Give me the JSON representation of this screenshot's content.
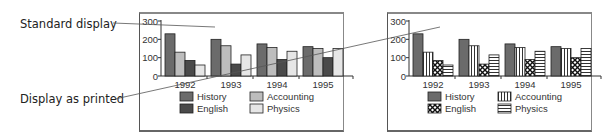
{
  "callouts": {
    "standard": "Standard display",
    "printed": "Display as printed"
  },
  "colors": {
    "history": "#6b6b6b",
    "accounting": "#bdbdbd",
    "english": "#4a4a4a",
    "physics": "#e6e6e6",
    "frame": "#555555"
  },
  "legend": {
    "history": "History",
    "accounting": "Accounting",
    "english": "English",
    "physics": "Physics"
  },
  "axis": {
    "y_ticks": [
      "0",
      "100",
      "200",
      "300"
    ],
    "x_ticks": [
      "1992",
      "1993",
      "1994",
      "1995"
    ]
  },
  "chart_data": [
    {
      "type": "bar",
      "title": "Standard display",
      "categories": [
        "1992",
        "1993",
        "1994",
        "1995"
      ],
      "series": [
        {
          "name": "History",
          "values": [
            230,
            200,
            175,
            160
          ],
          "fill": "solid dark gray"
        },
        {
          "name": "Accounting",
          "values": [
            130,
            165,
            155,
            150
          ],
          "fill": "solid light gray"
        },
        {
          "name": "English",
          "values": [
            85,
            65,
            90,
            100
          ],
          "fill": "solid darker gray"
        },
        {
          "name": "Physics",
          "values": [
            60,
            115,
            135,
            150
          ],
          "fill": "solid very light gray"
        }
      ],
      "xlabel": "",
      "ylabel": "",
      "ylim": [
        0,
        300
      ],
      "yticks": [
        0,
        100,
        200,
        300
      ],
      "grid": false,
      "legend_position": "bottom"
    },
    {
      "type": "bar",
      "title": "Display as printed",
      "categories": [
        "1992",
        "1993",
        "1994",
        "1995"
      ],
      "series": [
        {
          "name": "History",
          "values": [
            230,
            200,
            175,
            160
          ],
          "fill": "solid dark gray"
        },
        {
          "name": "Accounting",
          "values": [
            130,
            165,
            155,
            150
          ],
          "fill": "vertical stripes"
        },
        {
          "name": "English",
          "values": [
            85,
            65,
            90,
            100
          ],
          "fill": "crosshatch"
        },
        {
          "name": "Physics",
          "values": [
            60,
            115,
            135,
            150
          ],
          "fill": "horizontal stripes"
        }
      ],
      "xlabel": "",
      "ylabel": "",
      "ylim": [
        0,
        300
      ],
      "yticks": [
        0,
        100,
        200,
        300
      ],
      "grid": false,
      "legend_position": "bottom"
    }
  ]
}
